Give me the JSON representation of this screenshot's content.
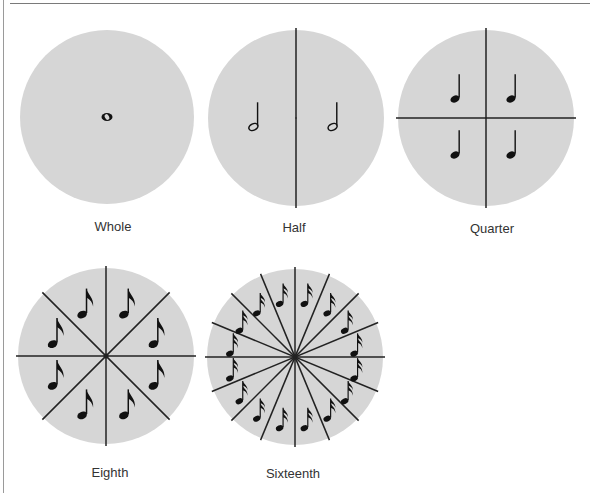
{
  "figure": {
    "colors": {
      "circle_fill": "#d6d6d6",
      "line": "#222222",
      "note": "#111111",
      "label": "#333333"
    },
    "diagrams": [
      {
        "name": "whole",
        "label": "Whole",
        "cx": 107,
        "cy": 117,
        "r": 87,
        "divisions": 1,
        "note": "whole",
        "label_x": 113,
        "label_y": 219
      },
      {
        "name": "half",
        "label": "Half",
        "cx": 296,
        "cy": 118,
        "r": 88,
        "divisions": 2,
        "note": "half",
        "label_x": 294,
        "label_y": 220
      },
      {
        "name": "quarter",
        "label": "Quarter",
        "cx": 486,
        "cy": 118,
        "r": 88,
        "divisions": 4,
        "note": "quarter",
        "label_x": 492,
        "label_y": 221
      },
      {
        "name": "eighth",
        "label": "Eighth",
        "cx": 106,
        "cy": 356,
        "r": 88,
        "divisions": 8,
        "note": "eighth",
        "label_x": 110,
        "label_y": 465
      },
      {
        "name": "sixteenth",
        "label": "Sixteenth",
        "cx": 295,
        "cy": 357,
        "r": 88,
        "divisions": 16,
        "note": "sixteenth",
        "label_x": 293,
        "label_y": 466
      }
    ]
  }
}
